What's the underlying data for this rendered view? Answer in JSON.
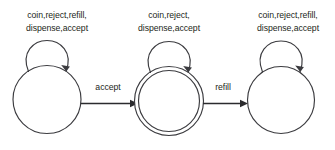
{
  "diagram": {
    "type": "state-machine",
    "stroke_color": "#3b3b3f",
    "text_color": "#231f20",
    "background_color": "#ffffff",
    "states": [
      {
        "id": "state-1",
        "accepting": false,
        "self_loop_label_line1": "coin,reject,refill,",
        "self_loop_label_line2": "dispense,accept",
        "self_loop_events": [
          "coin",
          "reject",
          "refill",
          "dispense",
          "accept"
        ]
      },
      {
        "id": "state-2",
        "accepting": true,
        "self_loop_label_line1": "coin,reject,",
        "self_loop_label_line2": "dispense,accept",
        "self_loop_events": [
          "coin",
          "reject",
          "dispense",
          "accept"
        ]
      },
      {
        "id": "state-3",
        "accepting": false,
        "self_loop_label_line1": "coin,reject,refill,",
        "self_loop_label_line2": "dispense,accept",
        "self_loop_events": [
          "coin",
          "reject",
          "refill",
          "dispense",
          "accept"
        ]
      }
    ],
    "transitions": [
      {
        "id": "transition-accept",
        "from": "state-1",
        "to": "state-2",
        "label": "accept"
      },
      {
        "id": "transition-refill",
        "from": "state-2",
        "to": "state-3",
        "label": "refill"
      }
    ]
  }
}
